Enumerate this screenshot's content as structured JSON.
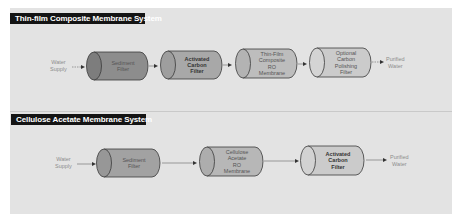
{
  "colors": {
    "panel_bg": "#e3e3e3",
    "title_bg": "#141414",
    "title_text": "#ffffff",
    "cylinder_dark": "#8a8a8a",
    "cylinder_mid": "#a6a6a6",
    "cylinder_light": "#c4c4c4",
    "cylinder_lighter": "#cdcdcd",
    "outline": "#3a3a3a",
    "label_text": "#8d8d8d"
  },
  "systems": [
    {
      "title": "Thin-film Composite Membrane System",
      "input_label": "Water\nSupply",
      "output_label": "Purified\nWater",
      "stages": [
        {
          "label": "Sediment\nFilter",
          "bold": false
        },
        {
          "label": "Activated\nCarbon\nFilter",
          "bold": true
        },
        {
          "label": "Thin-Film\nComposite\nRO\nMembrane",
          "bold": false
        },
        {
          "label": "Optional\nCarbon\nPolishing\nFilter",
          "bold": false
        }
      ]
    },
    {
      "title": "Cellulose Acetate Membrane System",
      "input_label": "Water\nSupply",
      "output_label": "Purified\nWater",
      "stages": [
        {
          "label": "Sediment\nFilter",
          "bold": false
        },
        {
          "label": "Cellulose\nAcetate\nRO\nMembrane",
          "bold": false
        },
        {
          "label": "Activated\nCarbon\nFilter",
          "bold": true
        }
      ]
    }
  ]
}
